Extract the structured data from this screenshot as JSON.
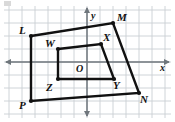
{
  "figure": {
    "background_color": "#ffffff",
    "grid_color": "#c9cfd4",
    "axis_color": "#6f767c",
    "shape_color": "#111111",
    "width": 175,
    "height": 122
  },
  "axes": {
    "x_label": "x",
    "y_label": "y",
    "origin_label": "O",
    "x_axis_y_px": 62,
    "y_axis_x_px": 87,
    "grid_spacing_px": 13,
    "show_grid": true,
    "x_arrow_left": true,
    "x_arrow_right": true,
    "y_arrow_up": true,
    "y_arrow_down": true
  },
  "shapes": [
    {
      "name": "outer-quadrilateral",
      "id": "LMNP",
      "closed": true,
      "stroke_width": 2.4,
      "vertices": [
        {
          "label": "L",
          "px": [
            31,
            36
          ],
          "label_px": [
            19,
            25
          ]
        },
        {
          "label": "M",
          "px": [
            113,
            23
          ],
          "label_px": [
            117,
            12
          ]
        },
        {
          "label": "N",
          "px": [
            139,
            93
          ],
          "label_px": [
            140,
            94
          ]
        },
        {
          "label": "P",
          "px": [
            31,
            101
          ],
          "label_px": [
            19,
            100
          ]
        }
      ]
    },
    {
      "name": "inner-quadrilateral",
      "id": "WXYZ",
      "closed": true,
      "stroke_width": 2.4,
      "vertices": [
        {
          "label": "W",
          "px": [
            58,
            49
          ],
          "label_px": [
            45,
            38
          ]
        },
        {
          "label": "X",
          "px": [
            101,
            44
          ],
          "label_px": [
            103,
            32
          ]
        },
        {
          "label": "Y",
          "px": [
            114,
            79
          ],
          "label_px": [
            113,
            80
          ]
        },
        {
          "label": "Z",
          "px": [
            58,
            79
          ],
          "label_px": [
            46,
            82
          ]
        }
      ]
    }
  ],
  "vertex_labels": [
    "L",
    "M",
    "N",
    "P",
    "W",
    "X",
    "Y",
    "Z"
  ],
  "origin": {
    "label": "O",
    "px": [
      76,
      70
    ]
  }
}
